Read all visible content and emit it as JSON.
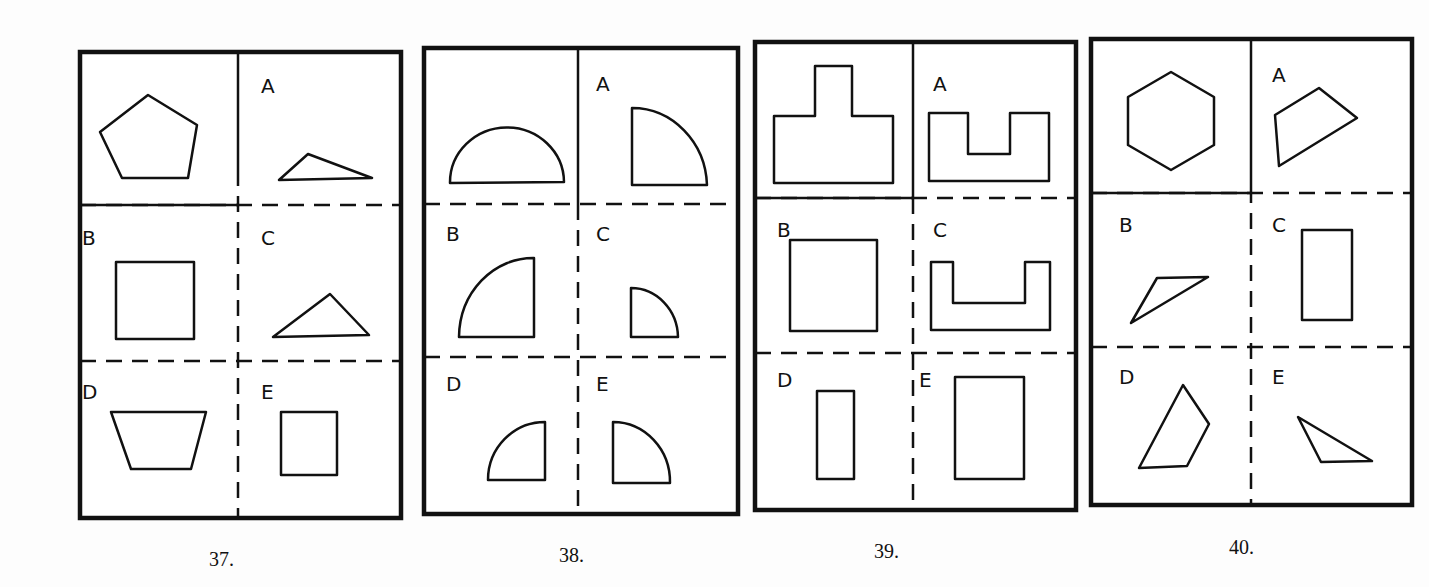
{
  "problems": [
    {
      "number": "37.",
      "stem": "regular-pentagon",
      "options": [
        {
          "label": "A",
          "shape": "obtuse-triangle"
        },
        {
          "label": "B",
          "shape": "square"
        },
        {
          "label": "C",
          "shape": "scalene-triangle"
        },
        {
          "label": "D",
          "shape": "trapezoid"
        },
        {
          "label": "E",
          "shape": "small-square"
        }
      ]
    },
    {
      "number": "38.",
      "stem": "semicircle",
      "options": [
        {
          "label": "A",
          "shape": "quarter-circle-right"
        },
        {
          "label": "B",
          "shape": "quarter-circle-left"
        },
        {
          "label": "C",
          "shape": "small-quarter-circle-right"
        },
        {
          "label": "D",
          "shape": "small-quarter-circle-left"
        },
        {
          "label": "E",
          "shape": "quarter-circle-right-medium"
        }
      ]
    },
    {
      "number": "39.",
      "stem": "t-shaped-block",
      "options": [
        {
          "label": "A",
          "shape": "u-shape-shallow"
        },
        {
          "label": "B",
          "shape": "square"
        },
        {
          "label": "C",
          "shape": "u-shape-wide"
        },
        {
          "label": "D",
          "shape": "narrow-rectangle"
        },
        {
          "label": "E",
          "shape": "tall-rectangle"
        }
      ]
    },
    {
      "number": "40.",
      "stem": "regular-hexagon",
      "options": [
        {
          "label": "A",
          "shape": "quadrilateral"
        },
        {
          "label": "B",
          "shape": "thin-parallelogram-triangle"
        },
        {
          "label": "C",
          "shape": "rectangle"
        },
        {
          "label": "D",
          "shape": "irregular-quadrilateral"
        },
        {
          "label": "E",
          "shape": "obtuse-triangle"
        }
      ]
    }
  ]
}
